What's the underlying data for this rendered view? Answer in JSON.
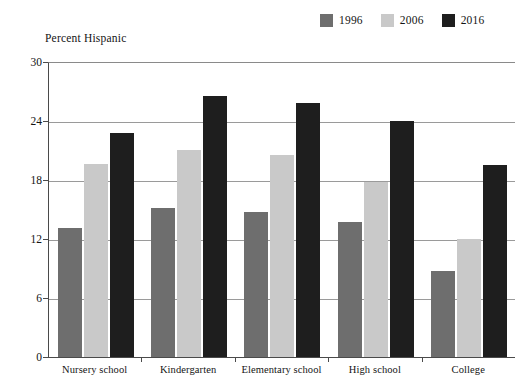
{
  "chart_data": {
    "type": "bar",
    "title": "",
    "ylabel": "Percent Hispanic",
    "xlabel": "",
    "ylim": [
      0,
      30
    ],
    "yticks": [
      0,
      6,
      12,
      18,
      24,
      30
    ],
    "grid": true,
    "legend_position": "top-right",
    "categories": [
      "Nursery school",
      "Kindergarten",
      "Elementary school",
      "High school",
      "College"
    ],
    "series": [
      {
        "name": "1996",
        "color": "#6e6e6e",
        "values": [
          13.1,
          15.2,
          14.7,
          13.7,
          8.7
        ]
      },
      {
        "name": "2006",
        "color": "#c9c9c9",
        "values": [
          19.6,
          21.1,
          20.5,
          17.8,
          12.0
        ]
      },
      {
        "name": "2016",
        "color": "#1e1e1e",
        "values": [
          22.8,
          26.5,
          25.8,
          24.0,
          19.5
        ]
      }
    ]
  },
  "legend": {
    "items": [
      {
        "label": "1996",
        "color": "#6e6e6e"
      },
      {
        "label": "2006",
        "color": "#c9c9c9"
      },
      {
        "label": "2016",
        "color": "#1e1e1e"
      }
    ]
  },
  "axis": {
    "y_title": "Percent Hispanic"
  }
}
